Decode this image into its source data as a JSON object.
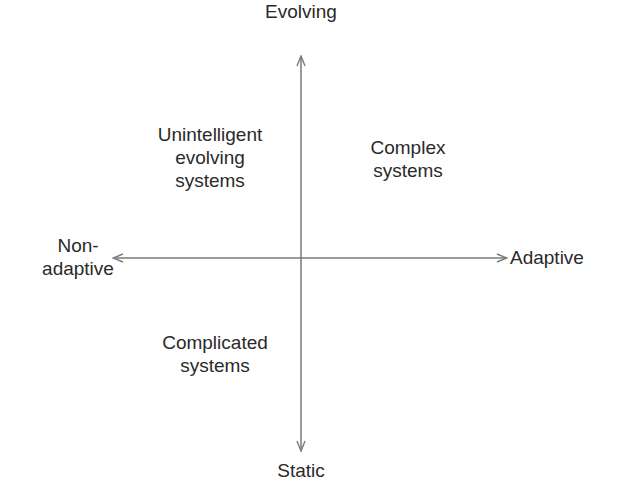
{
  "diagram": {
    "type": "quadrant",
    "axes": {
      "vertical": {
        "top_label": "Evolving",
        "bottom_label": "Static"
      },
      "horizontal": {
        "left_label": "Non-\nadaptive",
        "right_label": "Adaptive"
      }
    },
    "quadrants": {
      "top_left": "Unintelligent\nevolving\nsystems",
      "top_right": "Complex\nsystems",
      "bottom_left": "Complicated\nsystems",
      "bottom_right": ""
    },
    "colors": {
      "axis_line": "#7a7a7a",
      "text": "#2a2a2a",
      "background": "#ffffff"
    }
  }
}
